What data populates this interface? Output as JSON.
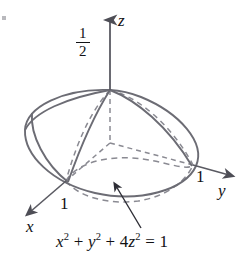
{
  "figure": {
    "equation_parts": {
      "x_var": "x",
      "x_exp": "2",
      "plus1": " + ",
      "y_var": "y",
      "y_exp": "2",
      "plus2": " + 4",
      "z_var": "z",
      "z_exp": "2",
      "equals": " = 1"
    },
    "equation_text": "x2 + y2 + 4z2 = 1",
    "axes": [
      {
        "name": "x",
        "label": "x",
        "tick_label": "1",
        "direction": "down-left"
      },
      {
        "name": "y",
        "label": "y",
        "tick_label": "1",
        "direction": "right"
      },
      {
        "name": "z",
        "label": "z",
        "tick_label": "1/2",
        "direction": "up"
      }
    ],
    "z_intercept": {
      "numerator": "1",
      "denominator": "2"
    },
    "y_intercept": "1",
    "x_intercept": "1",
    "colors": {
      "curve": "#6c6c74",
      "hidden_curve": "#8a8a92",
      "axis": "#5a5a62",
      "text": "#111114",
      "background": "#ffffff"
    },
    "shape": {
      "type": "ellipsoid",
      "semi_axis_x": 1,
      "semi_axis_y": 1,
      "semi_axis_z": 0.5
    },
    "annotation_arrow": {
      "name": "equation-pointer",
      "from": "equation",
      "to": "ellipsoid-surface"
    }
  }
}
